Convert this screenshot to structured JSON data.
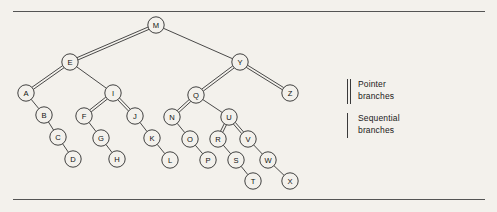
{
  "figure": {
    "background_color": "#f3f1ec",
    "rule_color": "#545454",
    "node_fill": "#f3f1ec",
    "node_stroke": "#2b2b2b",
    "node_radius": 8.2,
    "label_font_size": 7.6
  },
  "tree": {
    "root": "M",
    "nodes": [
      {
        "id": "M",
        "label": "M",
        "x": 156,
        "y": 25
      },
      {
        "id": "E",
        "label": "E",
        "x": 70,
        "y": 62
      },
      {
        "id": "Y",
        "label": "Y",
        "x": 240,
        "y": 62
      },
      {
        "id": "A",
        "label": "A",
        "x": 26,
        "y": 93
      },
      {
        "id": "I",
        "label": "I",
        "x": 113,
        "y": 93
      },
      {
        "id": "Q",
        "label": "Q",
        "x": 196,
        "y": 95
      },
      {
        "id": "Z",
        "label": "Z",
        "x": 290,
        "y": 93
      },
      {
        "id": "B",
        "label": "B",
        "x": 44,
        "y": 115
      },
      {
        "id": "F",
        "label": "F",
        "x": 84,
        "y": 116
      },
      {
        "id": "J",
        "label": "J",
        "x": 135,
        "y": 116
      },
      {
        "id": "N",
        "label": "N",
        "x": 172,
        "y": 117
      },
      {
        "id": "U",
        "label": "U",
        "x": 229,
        "y": 117
      },
      {
        "id": "C",
        "label": "C",
        "x": 58,
        "y": 137
      },
      {
        "id": "G",
        "label": "G",
        "x": 101,
        "y": 138
      },
      {
        "id": "K",
        "label": "K",
        "x": 152,
        "y": 138
      },
      {
        "id": "O",
        "label": "O",
        "x": 190,
        "y": 139
      },
      {
        "id": "R",
        "label": "R",
        "x": 218,
        "y": 139
      },
      {
        "id": "V",
        "label": "V",
        "x": 248,
        "y": 139
      },
      {
        "id": "D",
        "label": "D",
        "x": 73,
        "y": 159
      },
      {
        "id": "H",
        "label": "H",
        "x": 117,
        "y": 159
      },
      {
        "id": "L",
        "label": "L",
        "x": 170,
        "y": 160
      },
      {
        "id": "P",
        "label": "P",
        "x": 208,
        "y": 160
      },
      {
        "id": "S",
        "label": "S",
        "x": 236,
        "y": 160
      },
      {
        "id": "W",
        "label": "W",
        "x": 268,
        "y": 160
      },
      {
        "id": "T",
        "label": "T",
        "x": 253,
        "y": 181
      },
      {
        "id": "X",
        "label": "X",
        "x": 290,
        "y": 181
      }
    ],
    "edges": [
      {
        "from": "M",
        "to": "E",
        "type": "pointer"
      },
      {
        "from": "M",
        "to": "Y",
        "type": "sequential"
      },
      {
        "from": "E",
        "to": "A",
        "type": "pointer"
      },
      {
        "from": "E",
        "to": "I",
        "type": "sequential"
      },
      {
        "from": "A",
        "to": "B",
        "type": "sequential"
      },
      {
        "from": "B",
        "to": "C",
        "type": "sequential"
      },
      {
        "from": "C",
        "to": "D",
        "type": "sequential"
      },
      {
        "from": "I",
        "to": "F",
        "type": "pointer"
      },
      {
        "from": "I",
        "to": "J",
        "type": "pointer"
      },
      {
        "from": "F",
        "to": "G",
        "type": "sequential"
      },
      {
        "from": "G",
        "to": "H",
        "type": "sequential"
      },
      {
        "from": "J",
        "to": "K",
        "type": "sequential"
      },
      {
        "from": "K",
        "to": "L",
        "type": "sequential"
      },
      {
        "from": "Y",
        "to": "Q",
        "type": "pointer"
      },
      {
        "from": "Y",
        "to": "Z",
        "type": "pointer"
      },
      {
        "from": "Q",
        "to": "N",
        "type": "pointer"
      },
      {
        "from": "Q",
        "to": "U",
        "type": "sequential"
      },
      {
        "from": "N",
        "to": "O",
        "type": "sequential"
      },
      {
        "from": "O",
        "to": "P",
        "type": "sequential"
      },
      {
        "from": "U",
        "to": "R",
        "type": "pointer"
      },
      {
        "from": "U",
        "to": "V",
        "type": "pointer"
      },
      {
        "from": "R",
        "to": "S",
        "type": "sequential"
      },
      {
        "from": "S",
        "to": "T",
        "type": "sequential"
      },
      {
        "from": "V",
        "to": "W",
        "type": "sequential"
      },
      {
        "from": "W",
        "to": "X",
        "type": "sequential"
      }
    ]
  },
  "legend": {
    "items": [
      {
        "marker": "double-line",
        "line1": "Pointer",
        "line2": "branches"
      },
      {
        "marker": "single-line",
        "line1": "Sequential",
        "line2": "branches"
      }
    ]
  }
}
